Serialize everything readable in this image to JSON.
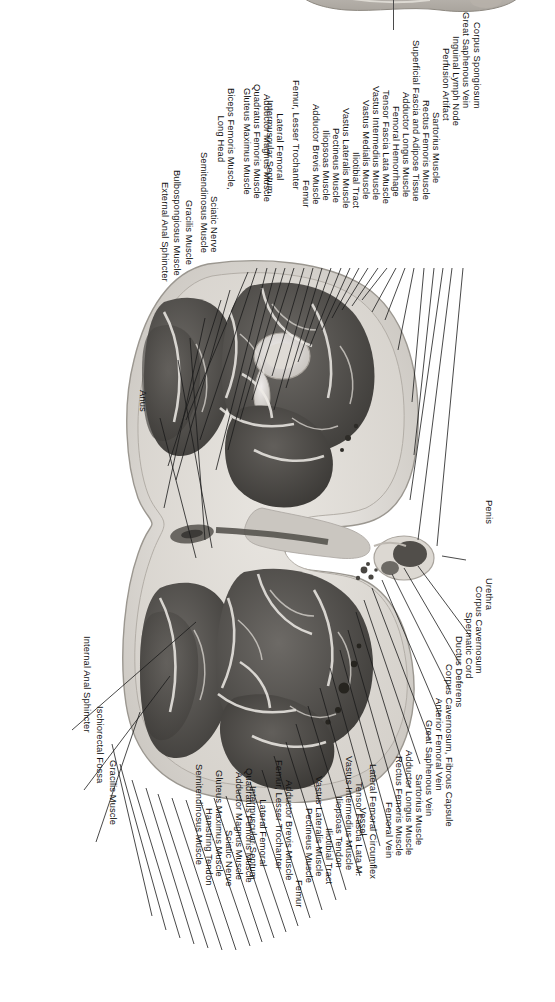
{
  "figure": {
    "type": "anatomical-cross-section",
    "region": "Axial section through upper thighs and perineum (male pelvis)",
    "orientation_tag": "Right",
    "corner_tag": "1",
    "modality": "cadaver cryosection photograph, grayscale"
  },
  "labels_top": [
    {
      "id": "corpus-spongiosum",
      "text": "Corpus Spongiosum"
    },
    {
      "id": "great-saphenous-vein-top",
      "text": "Great Saphenous Vein"
    },
    {
      "id": "inguinal-lymph-node",
      "text": "Inguinal Lymph Node"
    },
    {
      "id": "perfusion-artifact",
      "text": "Perfusion Artifact"
    },
    {
      "id": "sartorius-muscle-top",
      "text": "Sartorius Muscle"
    },
    {
      "id": "rectus-femoris-muscle-top",
      "text": "Rectus Femoris Muscle"
    },
    {
      "id": "superficial-fascia-adipose",
      "text": "Superficial Fascia and Adipose Tissue"
    },
    {
      "id": "adductor-longus-muscle-top",
      "text": "Adductor Longus Muscle"
    },
    {
      "id": "femoral-hemorrhage",
      "text": "Femoral Hemorrhage"
    },
    {
      "id": "tensor-fascia-lata-muscle",
      "text": "Tensor Fascia Lata Muscle"
    },
    {
      "id": "vastus-intermedius-muscle-top",
      "text": "Vastus Intermedius Muscle"
    },
    {
      "id": "vastus-medialis-muscle",
      "text": "Vastus Medialis Muscle"
    },
    {
      "id": "iliotibial-tract-top",
      "text": "Iliotibial Tract"
    },
    {
      "id": "vastus-lateralis-muscle-top",
      "text": "Vastus Lateralis Muscle"
    },
    {
      "id": "pectineus-muscle-top",
      "text": "Pectineus Muscle"
    },
    {
      "id": "iliopsoas-muscle",
      "text": "Iliopsoas Muscle"
    },
    {
      "id": "adductor-brevis-muscle-top",
      "text": "Adductor Brevis Muscle"
    },
    {
      "id": "femur-top",
      "text": "Femur"
    },
    {
      "id": "femur-lesser-trochanter-top",
      "text": "Femur, Lesser Trochanter"
    },
    {
      "id": "lateral-femoral-septum-top",
      "line1": "Lateral Femoral",
      "line2": "Intermuscular Septum"
    },
    {
      "id": "adductor-magnus-muscle-top",
      "text": "Adductor Magnus Muscle"
    },
    {
      "id": "quadratus-femoris-muscle-top",
      "text": "Quadratus Femoris Muscle"
    },
    {
      "id": "gluteus-maximus-muscle-top",
      "text": "Gluteus Maximus Muscle"
    },
    {
      "id": "biceps-femoris-long-head",
      "line1": "Biceps Femoris Muscle,",
      "line2": "Long Head"
    },
    {
      "id": "sciatic-nerve-top",
      "text": "Sciatic Nerve"
    },
    {
      "id": "semitendinosus-muscle-top",
      "text": "Semitendinosus Muscle"
    },
    {
      "id": "gracilis-muscle-top",
      "text": "Gracilis Muscle"
    },
    {
      "id": "bulbospongiosus-muscle",
      "text": "Bulbospongiosus Muscle"
    },
    {
      "id": "external-anal-sphincter",
      "text": "External Anal Sphincter"
    },
    {
      "id": "anus",
      "text": "Anus"
    }
  ],
  "labels_bottom": [
    {
      "id": "penis",
      "text": "Penis"
    },
    {
      "id": "urethra",
      "text": "Urethra"
    },
    {
      "id": "corpus-cavernosum",
      "text": "Corpus Cavernosum"
    },
    {
      "id": "spermatic-cord",
      "text": "Spermatic Cord"
    },
    {
      "id": "ductus-deferens",
      "text": "Ductus Deferens"
    },
    {
      "id": "corpus-cavernosum-fibrous-capsule",
      "text": "Corpus Cavernosum, Fibrous Capsule"
    },
    {
      "id": "anterior-femoral-vein",
      "text": "Anterior Femoral Vein"
    },
    {
      "id": "great-saphenous-vein-bottom",
      "text": "Great Saphenous Vein"
    },
    {
      "id": "sartorius-muscle-bottom",
      "text": "Sartorius Muscle"
    },
    {
      "id": "adductor-longus-muscle-bottom",
      "text": "Adductor Longus Muscle"
    },
    {
      "id": "rectus-femoris-muscle-bottom",
      "text": "Rectus Femoris Muscle"
    },
    {
      "id": "femoral-vein",
      "text": "Femoral Vein"
    },
    {
      "id": "lateral-femoral-circumflex-vessel",
      "line1": "Lateral Femoral Circumflex",
      "line2": "Vessel"
    },
    {
      "id": "tensor-fascia-lata-m",
      "text": "Tensor Fascia Lata M."
    },
    {
      "id": "vastus-intermedius-muscle-bottom",
      "text": "Vastus Intermedius Muscle"
    },
    {
      "id": "iliopsoas-tendon",
      "text": "Iliopsoas Tendon"
    },
    {
      "id": "iliotibial-tract-bottom",
      "text": "Iliotibial Tract"
    },
    {
      "id": "vastus-lateralis-muscle-bottom",
      "text": "Vastus Lateralis Muscle"
    },
    {
      "id": "pectineus-muscle-bottom",
      "text": "Pectineus Muscle"
    },
    {
      "id": "femur-bottom",
      "text": "Femur"
    },
    {
      "id": "adductor-brevis-muscle-bottom",
      "text": "Adductor Brevis Muscle"
    },
    {
      "id": "femur-lesser-trochanter-bottom",
      "text": "Femur, Lesser Trochanter"
    },
    {
      "id": "lateral-femoral-septum-bottom",
      "line1": "Lateral Femoral",
      "line2": "Intermuscular Septum"
    },
    {
      "id": "quadratus-femoris-muscle-bottom",
      "text": "Quadratus Femoris Muscle"
    },
    {
      "id": "adductor-magnus-muscle-bottom",
      "text": "Adductor Magnus Muscle"
    },
    {
      "id": "sciatic-nerve-bottom",
      "text": "Sciatic Nerve"
    },
    {
      "id": "gluteus-maximus-muscle-bottom",
      "text": "Gluteus Maximus Muscle"
    },
    {
      "id": "hamstring-tendon",
      "text": "Hamstring Tendon"
    },
    {
      "id": "semitendinosus-muscle-bottom",
      "text": "Semitendinosus Muscle"
    },
    {
      "id": "gracilis-muscle-bottom",
      "text": "Gracilis Muscle"
    },
    {
      "id": "ischiorectal-fossa",
      "text": "Ischiorectal Fossa"
    },
    {
      "id": "internal-anal-sphincter",
      "text": "Internal Anal Sphincter"
    }
  ]
}
